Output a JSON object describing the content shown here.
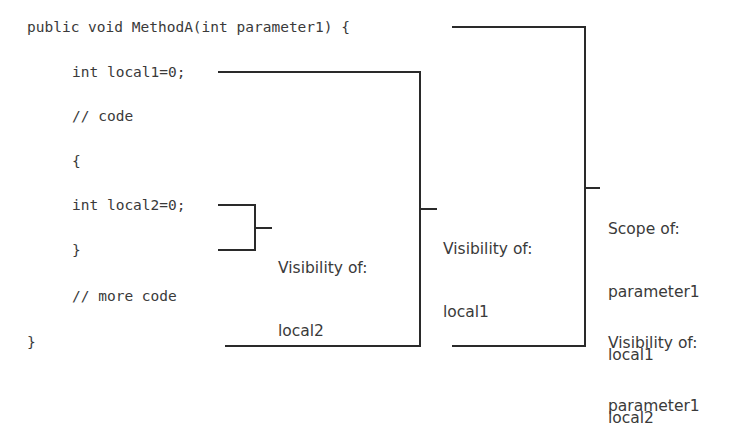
{
  "code_lines": [
    "public void MethodA(int parameter1) {",
    "int local1=0;",
    "// code",
    "{",
    "int local2=0;",
    "}",
    "// more code",
    "}"
  ],
  "annotations": {
    "local2": [
      "Visibility of:",
      "local2"
    ],
    "local1": [
      "Visibility of:",
      "local1"
    ],
    "scope": [
      "Scope of:",
      "parameter1",
      "local1",
      "local2"
    ],
    "param_visibility": [
      "Visibility of:",
      "parameter1"
    ]
  }
}
